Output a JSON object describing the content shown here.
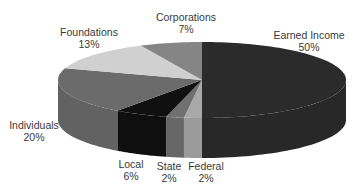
{
  "chart_data": {
    "type": "pie",
    "style": "3d-exploded-none",
    "title": "",
    "categories": [
      "Earned Income",
      "Federal",
      "State",
      "Local",
      "Individuals",
      "Foundations",
      "Corporations"
    ],
    "values": [
      50,
      2,
      2,
      6,
      20,
      13,
      7
    ],
    "unit": "%",
    "colors": [
      "#2b2b2b",
      "#a9a9a9",
      "#707070",
      "#101010",
      "#6b6b6b",
      "#d0d0d0",
      "#858585"
    ],
    "legend": "none",
    "labels": [
      {
        "name": "Earned Income",
        "value": "50%"
      },
      {
        "name": "Federal",
        "value": "2%"
      },
      {
        "name": "State",
        "value": "2%"
      },
      {
        "name": "Local",
        "value": "6%"
      },
      {
        "name": "Individuals",
        "value": "20%"
      },
      {
        "name": "Foundations",
        "value": "13%"
      },
      {
        "name": "Corporations",
        "value": "7%"
      }
    ]
  }
}
